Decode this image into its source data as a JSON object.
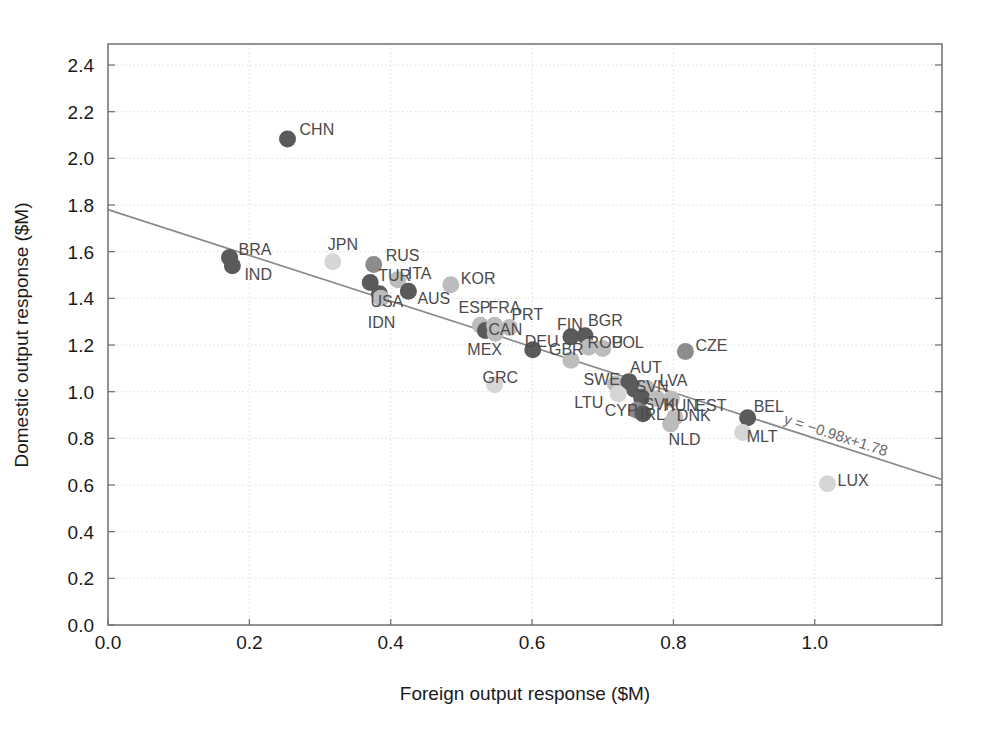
{
  "chart_data": {
    "type": "scatter",
    "title": "",
    "xlabel": "Foreign output response ($M)",
    "ylabel": "Domestic output response ($M)",
    "xlim": [
      0.0,
      1.18
    ],
    "ylim": [
      0.0,
      2.49
    ],
    "xticks": [
      "0.0",
      "0.2",
      "0.4",
      "0.6",
      "0.8",
      "1.0"
    ],
    "xtick_values": [
      0.0,
      0.2,
      0.4,
      0.6,
      0.8,
      1.0
    ],
    "yticks": [
      "0.0",
      "0.2",
      "0.4",
      "0.6",
      "0.8",
      "1.0",
      "1.2",
      "1.4",
      "1.6",
      "1.8",
      "2.0",
      "2.2",
      "2.4"
    ],
    "ytick_values": [
      0.0,
      0.2,
      0.4,
      0.6,
      0.8,
      1.0,
      1.2,
      1.4,
      1.6,
      1.8,
      2.0,
      2.2,
      2.4
    ],
    "grid": true,
    "legend": "none",
    "fit_line": {
      "equation": "y = −0.98x+1.78",
      "slope": -0.98,
      "intercept": 1.78,
      "x_start": 0.0,
      "x_end": 1.18
    },
    "marker_colors": {
      "dark": "#5a5a5a",
      "medium": "#8c8c8c",
      "light": "#bcbcbc",
      "very_light": "#d6d6d6"
    },
    "points": [
      {
        "label": "CHN",
        "x": 0.254,
        "y": 2.083,
        "shade": "dark",
        "lx": 12,
        "ly": -4
      },
      {
        "label": "BRA",
        "x": 0.172,
        "y": 1.575,
        "shade": "dark",
        "lx": 9,
        "ly": -3
      },
      {
        "label": "IND",
        "x": 0.176,
        "y": 1.54,
        "shade": "dark",
        "lx": 12,
        "ly": 14
      },
      {
        "label": "JPN",
        "x": 0.318,
        "y": 1.557,
        "shade": "very_light",
        "lx": -5,
        "ly": -12
      },
      {
        "label": "RUS",
        "x": 0.376,
        "y": 1.545,
        "shade": "medium",
        "lx": 12,
        "ly": -4
      },
      {
        "label": "TUR",
        "x": 0.371,
        "y": 1.468,
        "shade": "dark",
        "lx": 8,
        "ly": -1
      },
      {
        "label": "USA",
        "x": 0.384,
        "y": 1.42,
        "shade": "dark",
        "lx": -9,
        "ly": 13
      },
      {
        "label": "ITA",
        "x": 0.41,
        "y": 1.48,
        "shade": "light",
        "lx": 10,
        "ly": -1
      },
      {
        "label": "AUS",
        "x": 0.425,
        "y": 1.43,
        "shade": "dark",
        "lx": 9,
        "ly": 13
      },
      {
        "label": "KOR",
        "x": 0.485,
        "y": 1.458,
        "shade": "light",
        "lx": 10,
        "ly": -1
      },
      {
        "label": "IDN",
        "x": 0.386,
        "y": 1.4,
        "shade": "light",
        "lx": -13,
        "ly": 30
      },
      {
        "label": "ESP",
        "x": 0.527,
        "y": 1.285,
        "shade": "light",
        "lx": -22,
        "ly": -12
      },
      {
        "label": "CAN",
        "x": 0.534,
        "y": 1.262,
        "shade": "dark",
        "lx": 3,
        "ly": 4
      },
      {
        "label": "MEX",
        "x": 0.548,
        "y": 1.25,
        "shade": "light",
        "lx": -28,
        "ly": 22
      },
      {
        "label": "FRA",
        "x": 0.547,
        "y": 1.285,
        "shade": "light",
        "lx": -6,
        "ly": -12
      },
      {
        "label": "PRT",
        "x": 0.568,
        "y": 1.275,
        "shade": "light",
        "lx": 2,
        "ly": -8
      },
      {
        "label": "GRC",
        "x": 0.547,
        "y": 1.03,
        "shade": "very_light",
        "lx": -12,
        "ly": -2
      },
      {
        "label": "DEU",
        "x": 0.601,
        "y": 1.18,
        "shade": "dark",
        "lx": -8,
        "ly": -3
      },
      {
        "label": "FIN",
        "x": 0.655,
        "y": 1.235,
        "shade": "dark",
        "lx": -14,
        "ly": -7
      },
      {
        "label": "BGR",
        "x": 0.675,
        "y": 1.24,
        "shade": "dark",
        "lx": 3,
        "ly": -10
      },
      {
        "label": "ROU",
        "x": 0.68,
        "y": 1.19,
        "shade": "light",
        "lx": -1,
        "ly": 1
      },
      {
        "label": "POL",
        "x": 0.7,
        "y": 1.185,
        "shade": "light",
        "lx": 9,
        "ly": -1
      },
      {
        "label": "GBR",
        "x": 0.655,
        "y": 1.135,
        "shade": "light",
        "lx": -22,
        "ly": -5
      },
      {
        "label": "SWE",
        "x": 0.718,
        "y": 1.033,
        "shade": "light",
        "lx": -32,
        "ly": 1
      },
      {
        "label": "AUT",
        "x": 0.737,
        "y": 1.043,
        "shade": "dark",
        "lx": 1,
        "ly": -9
      },
      {
        "label": "SVN",
        "x": 0.745,
        "y": 1.01,
        "shade": "dark",
        "lx": 1,
        "ly": 3
      },
      {
        "label": "LVA",
        "x": 0.762,
        "y": 1.015,
        "shade": "light",
        "lx": 13,
        "ly": -2
      },
      {
        "label": "LTU",
        "x": 0.722,
        "y": 0.99,
        "shade": "very_light",
        "lx": -44,
        "ly": 14
      },
      {
        "label": "SVK",
        "x": 0.755,
        "y": 0.975,
        "shade": "dark",
        "lx": 2,
        "ly": 12
      },
      {
        "label": "HUN",
        "x": 0.777,
        "y": 0.97,
        "shade": "light",
        "lx": 6,
        "ly": 12
      },
      {
        "label": "EST",
        "x": 0.797,
        "y": 0.968,
        "shade": "light",
        "lx": 24,
        "ly": 12
      },
      {
        "label": "CYP",
        "x": 0.748,
        "y": 0.92,
        "shade": "medium",
        "lx": -32,
        "ly": 6
      },
      {
        "label": "IRL",
        "x": 0.757,
        "y": 0.905,
        "shade": "dark",
        "lx": -3,
        "ly": 6
      },
      {
        "label": "DNK",
        "x": 0.802,
        "y": 0.89,
        "shade": "light",
        "lx": 2,
        "ly": 4
      },
      {
        "label": "NLD",
        "x": 0.796,
        "y": 0.862,
        "shade": "light",
        "lx": -2,
        "ly": 21
      },
      {
        "label": "CZE",
        "x": 0.817,
        "y": 1.172,
        "shade": "medium",
        "lx": 10,
        "ly": -1
      },
      {
        "label": "BEL",
        "x": 0.905,
        "y": 0.888,
        "shade": "dark",
        "lx": 6,
        "ly": -6
      },
      {
        "label": "MLT",
        "x": 0.898,
        "y": 0.825,
        "shade": "very_light",
        "lx": 4,
        "ly": 9
      },
      {
        "label": "LUX",
        "x": 1.018,
        "y": 0.605,
        "shade": "very_light",
        "lx": 10,
        "ly": 2
      }
    ]
  }
}
